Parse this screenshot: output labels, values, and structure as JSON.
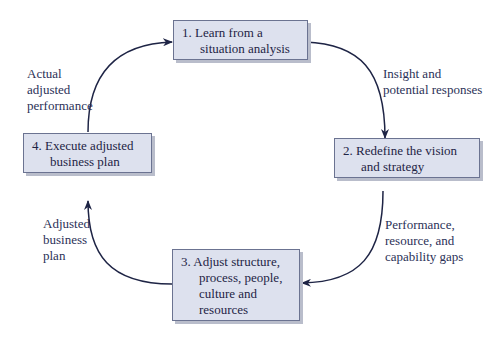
{
  "diagram": {
    "type": "cycle",
    "steps": [
      {
        "id": 1,
        "lines": [
          "1. Learn from a",
          "situation analysis"
        ]
      },
      {
        "id": 2,
        "lines": [
          "2. Redefine the vision",
          "and strategy"
        ]
      },
      {
        "id": 3,
        "lines": [
          "3. Adjust structure,",
          "process, people,",
          "culture and",
          "resources"
        ]
      },
      {
        "id": 4,
        "lines": [
          "4. Execute adjusted",
          "business plan"
        ]
      }
    ],
    "transitions": [
      {
        "from": 1,
        "to": 2,
        "lines": [
          "Insight and",
          "potential responses"
        ]
      },
      {
        "from": 2,
        "to": 3,
        "lines": [
          "Performance,",
          "resource, and",
          "capability gaps"
        ]
      },
      {
        "from": 3,
        "to": 4,
        "lines": [
          "Adjusted",
          "business",
          "plan"
        ]
      },
      {
        "from": 4,
        "to": 1,
        "lines": [
          "Actual",
          "adjusted",
          "performance"
        ]
      }
    ],
    "colors": {
      "box_fill": "#dde1ee",
      "box_border": "#6b7391",
      "arrow": "#1e2445",
      "text": "#1e2445"
    }
  }
}
